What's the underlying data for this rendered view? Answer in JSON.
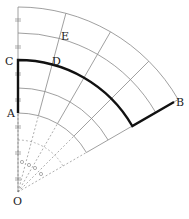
{
  "diagram": {
    "origin_label": "O",
    "points": [
      {
        "label": "A",
        "x": 8,
        "y": 117
      },
      {
        "label": "C",
        "x": 5,
        "y": 64
      },
      {
        "label": "D",
        "x": 52,
        "y": 64
      },
      {
        "label": "E",
        "x": 61,
        "y": 39
      },
      {
        "label": "B",
        "x": 176,
        "y": 106
      }
    ],
    "colors": {
      "grid": "#888888",
      "path": "#111111",
      "guide": "#777777"
    }
  }
}
